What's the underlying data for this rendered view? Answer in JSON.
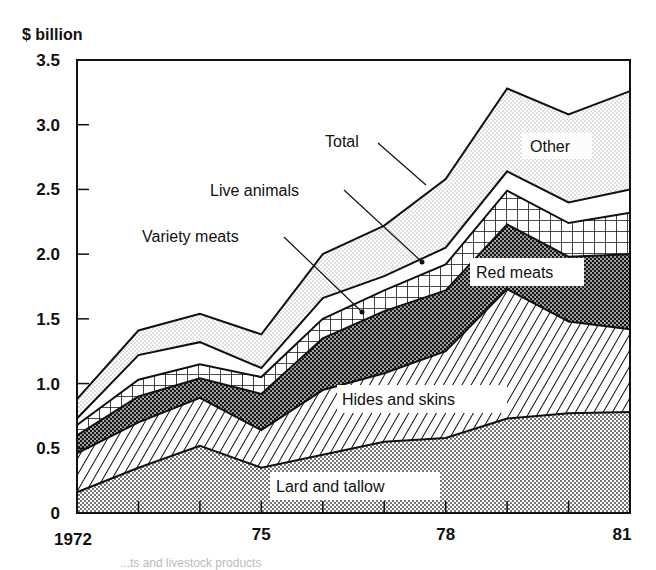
{
  "chart_data": {
    "type": "area",
    "stacked": true,
    "title": "",
    "unit_label": "$ billion",
    "xlabel": "",
    "ylabel": "$ billion",
    "ylim": [
      0,
      3.5
    ],
    "yticks": [
      "0",
      "0.5",
      "1.0",
      "1.5",
      "2.0",
      "2.5",
      "3.0",
      "3.5"
    ],
    "xticks": [
      "1972",
      "75",
      "78",
      "81"
    ],
    "x": [
      1972,
      1973,
      1974,
      1975,
      1976,
      1977,
      1978,
      1979,
      1980,
      1981
    ],
    "grid": false,
    "legend_position": "inline labels",
    "series": [
      {
        "name": "Lard and tallow",
        "pattern": "fine-dots",
        "values": [
          0.16,
          0.35,
          0.52,
          0.35,
          0.45,
          0.55,
          0.58,
          0.73,
          0.77,
          0.78
        ]
      },
      {
        "name": "Hides and skins",
        "pattern": "diagonal-hatch",
        "values": [
          0.3,
          0.35,
          0.37,
          0.29,
          0.5,
          0.53,
          0.67,
          1.0,
          0.71,
          0.64
        ]
      },
      {
        "name": "Red meats",
        "pattern": "dense-dark-dots",
        "values": [
          0.14,
          0.2,
          0.15,
          0.28,
          0.4,
          0.48,
          0.47,
          0.5,
          0.5,
          0.58
        ]
      },
      {
        "name": "Variety meats",
        "pattern": "crosshatch-grid",
        "values": [
          0.08,
          0.13,
          0.11,
          0.13,
          0.15,
          0.16,
          0.2,
          0.26,
          0.26,
          0.32
        ]
      },
      {
        "name": "Live animals",
        "pattern": "white",
        "values": [
          0.05,
          0.19,
          0.17,
          0.07,
          0.16,
          0.11,
          0.13,
          0.15,
          0.16,
          0.18
        ]
      },
      {
        "name": "Other",
        "pattern": "light-dots",
        "values": [
          0.15,
          0.19,
          0.22,
          0.26,
          0.34,
          0.39,
          0.53,
          0.64,
          0.68,
          0.76
        ]
      }
    ],
    "total": {
      "name": "Total",
      "values": [
        0.88,
        1.41,
        1.54,
        1.38,
        2.0,
        2.22,
        2.58,
        3.28,
        3.08,
        3.26
      ]
    },
    "annotations": [
      "Total",
      "Live animals",
      "Variety meats",
      "Red meats",
      "Other",
      "Hides and skins",
      "Lard and tallow"
    ]
  },
  "labels": {
    "unit": "$ billion",
    "total": "Total",
    "live": "Live animals",
    "variety": "Variety meats",
    "red": "Red meats",
    "other": "Other",
    "hides": "Hides and skins",
    "lard": "Lard and tallow"
  },
  "caption": "...ts and livestock products"
}
